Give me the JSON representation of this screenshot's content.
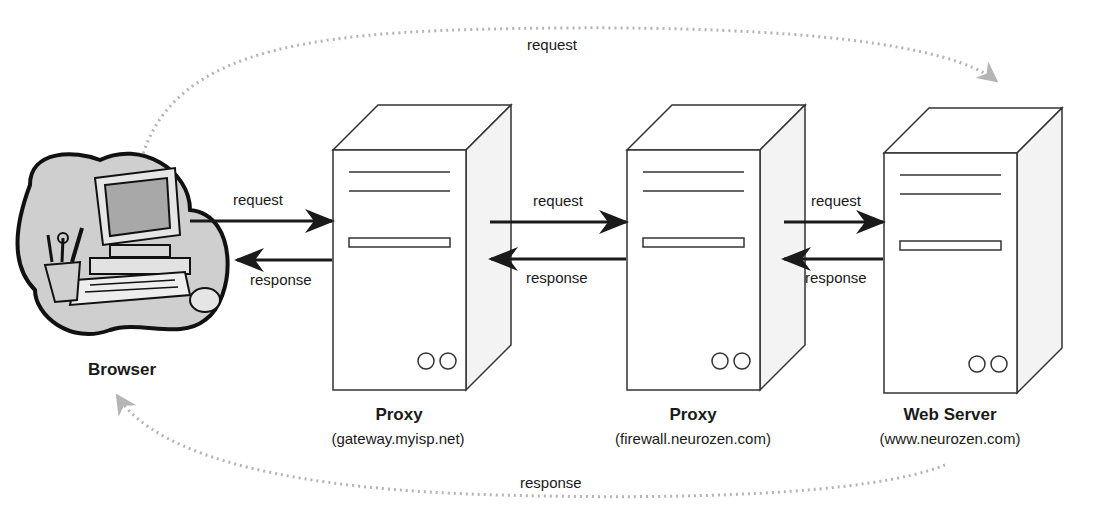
{
  "browser": {
    "label": "Browser",
    "icon": "computer-clipart-icon"
  },
  "nodes": [
    {
      "title": "Proxy",
      "host": "(gateway.myisp.net)"
    },
    {
      "title": "Proxy",
      "host": "(firewall.neurozen.com)"
    },
    {
      "title": "Web Server",
      "host": "(www.neurozen.com)"
    }
  ],
  "links": [
    {
      "request": "request",
      "response": "response"
    },
    {
      "request": "request",
      "response": "response"
    },
    {
      "request": "request",
      "response": "response"
    }
  ],
  "overall": {
    "request": "request",
    "response": "response"
  },
  "colors": {
    "line": "#1a1a1a",
    "dotted": "#b5b5b5",
    "cloud": "#c9c9c9"
  }
}
